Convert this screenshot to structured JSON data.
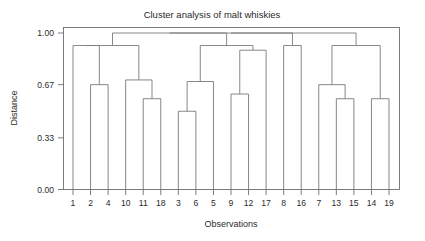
{
  "figure": {
    "title": "Cluster analysis of malt whiskies",
    "xlabel": "Observations",
    "ylabel": "Distance"
  },
  "chart_data": {
    "type": "line",
    "subtype": "dendrogram",
    "title": "Cluster analysis of malt whiskies",
    "xlabel": "Observations",
    "ylabel": "Distance",
    "ylim": [
      0.0,
      1.0
    ],
    "ytick_labels": [
      "0.00",
      "0.33",
      "0.67",
      "1.00"
    ],
    "ytick_values": [
      0.0,
      0.33,
      0.67,
      1.0
    ],
    "grid": false,
    "legend": "none",
    "leaf_order": [
      "1",
      "2",
      "4",
      "10",
      "11",
      "18",
      "3",
      "6",
      "5",
      "9",
      "12",
      "17",
      "8",
      "16",
      "7",
      "13",
      "15",
      "14",
      "19"
    ],
    "leaf_count": 19,
    "xtick_labels": [
      "1",
      "2",
      "4",
      "10",
      "11",
      "18",
      "3",
      "6",
      "5",
      "9",
      "12",
      "17",
      "8",
      "16",
      "7",
      "13",
      "15",
      "14",
      "19"
    ],
    "merges": [
      {
        "id": "m1",
        "left": "2",
        "right": "4",
        "height": 0.67
      },
      {
        "id": "m2",
        "left": "1",
        "right": "m1",
        "height": 0.92
      },
      {
        "id": "m3",
        "left": "11",
        "right": "18",
        "height": 0.58
      },
      {
        "id": "m4",
        "left": "10",
        "right": "m3",
        "height": 0.7
      },
      {
        "id": "m5",
        "left": "m2",
        "right": "m4",
        "height": 0.92
      },
      {
        "id": "m6",
        "left": "3",
        "right": "6",
        "height": 0.5
      },
      {
        "id": "m7",
        "left": "m6",
        "right": "5",
        "height": 0.69
      },
      {
        "id": "m8",
        "left": "9",
        "right": "12",
        "height": 0.61
      },
      {
        "id": "m9",
        "left": "m8",
        "right": "17",
        "height": 0.89
      },
      {
        "id": "m10",
        "left": "m7",
        "right": "m9",
        "height": 0.92
      },
      {
        "id": "m11",
        "left": "8",
        "right": "16",
        "height": 0.92
      },
      {
        "id": "m12",
        "left": "13",
        "right": "15",
        "height": 0.58
      },
      {
        "id": "m13",
        "left": "7",
        "right": "m12",
        "height": 0.67
      },
      {
        "id": "m14",
        "left": "14",
        "right": "19",
        "height": 0.58
      },
      {
        "id": "m15",
        "left": "m13",
        "right": "m14",
        "height": 0.92
      },
      {
        "id": "m16",
        "left": "m5",
        "right": "m10",
        "height": 1.0
      },
      {
        "id": "m17",
        "left": "m16",
        "right": "m11",
        "height": 1.0
      },
      {
        "id": "m18",
        "left": "m17",
        "right": "m15",
        "height": 1.0
      }
    ],
    "colors": {
      "line": "#7a7a7a",
      "axis": "#6e6e6e",
      "text": "#2b2b2b",
      "background": "#ffffff"
    }
  }
}
